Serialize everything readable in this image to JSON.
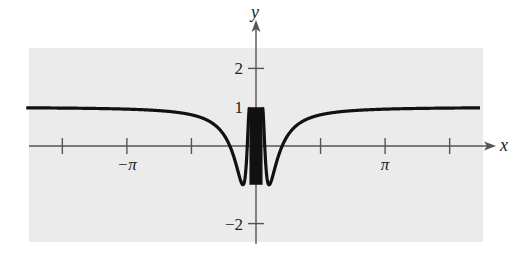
{
  "chart_data": {
    "type": "line",
    "title": "",
    "function": "y = cos(1/x)",
    "xlabel": "x",
    "ylabel": "y",
    "xlim": [
      -5.59,
      5.45
    ],
    "ylim": [
      -2.5,
      2.6
    ],
    "x_ticks": [
      {
        "value": -4.712,
        "label": ""
      },
      {
        "value": -3.1416,
        "label": "−π"
      },
      {
        "value": -1.5708,
        "label": ""
      },
      {
        "value": 1.5708,
        "label": ""
      },
      {
        "value": 3.1416,
        "label": "π"
      },
      {
        "value": 4.712,
        "label": ""
      }
    ],
    "y_ticks": [
      {
        "value": 2,
        "label": "2"
      },
      {
        "value": 1,
        "label": "1",
        "tick": false
      },
      {
        "value": -2,
        "label": "−2"
      }
    ],
    "series": [
      {
        "name": "cos(1/x)",
        "x": [
          -5.5,
          -4,
          -3,
          -2,
          -1.5,
          -1,
          -0.7,
          -0.5,
          -0.4,
          -0.318,
          -0.25,
          -0.2,
          -0.159,
          0.159,
          0.2,
          0.25,
          0.318,
          0.4,
          0.5,
          0.7,
          1,
          1.5,
          2,
          3,
          4,
          5.4
        ],
        "y": [
          0.983,
          0.969,
          0.945,
          0.878,
          0.786,
          0.54,
          0.14,
          -0.416,
          -0.801,
          -1.0,
          -0.654,
          0.284,
          1.0,
          1.0,
          0.284,
          -0.654,
          -1.0,
          -0.801,
          -0.416,
          0.14,
          0.54,
          0.786,
          0.878,
          0.945,
          0.969,
          0.983
        ]
      }
    ],
    "annotations": [
      "oscillation band between y = −1 and y = 1 near x = 0"
    ],
    "grid": false,
    "legend": null
  },
  "colors": {
    "background": "#ffffff",
    "plot_area": "#ebebeb",
    "axis": "#555555",
    "curve": "#111111"
  }
}
